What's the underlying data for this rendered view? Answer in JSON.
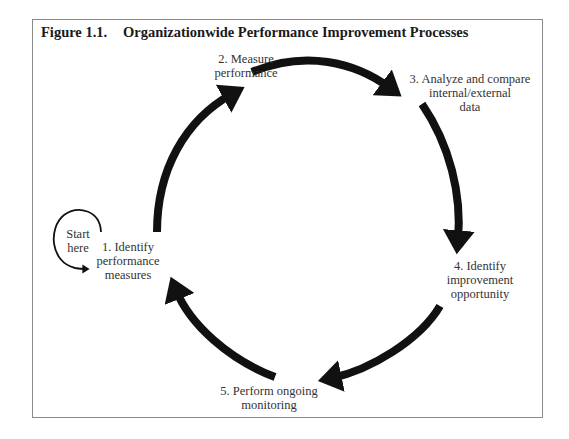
{
  "figure": {
    "number": "Figure 1.1.",
    "title": "Organizationwide Performance Improvement Processes"
  },
  "start_label": [
    "Start",
    "here"
  ],
  "steps": [
    {
      "id": 1,
      "lines": [
        "1. Identify",
        "performance",
        "measures"
      ]
    },
    {
      "id": 2,
      "lines": [
        "2. Measure",
        "performance"
      ]
    },
    {
      "id": 3,
      "lines": [
        "3. Analyze and compare",
        "internal/external",
        "data"
      ]
    },
    {
      "id": 4,
      "lines": [
        "4. Identify",
        "improvement",
        "opportunity"
      ]
    },
    {
      "id": 5,
      "lines": [
        "5. Perform ongoing",
        "monitoring"
      ]
    }
  ],
  "flow": [
    "1 -> 2",
    "2 -> 3",
    "3 -> 4",
    "4 -> 5",
    "5 -> 1"
  ],
  "colors": {
    "arrow": "#111111",
    "frame": "#8a8a8a",
    "text": "#333333"
  }
}
